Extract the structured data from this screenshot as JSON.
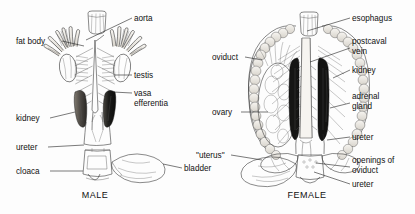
{
  "figure": {
    "background_color": "#fdfdfd",
    "ink_color": "#2a2a2a",
    "captions": [
      {
        "id": "male",
        "text": "MALE",
        "x": 95,
        "y": 198
      },
      {
        "id": "female",
        "text": "FEMALE",
        "x": 307,
        "y": 198
      }
    ]
  },
  "male_panel": {
    "caption": "MALE",
    "labels": [
      {
        "id": "fat-body",
        "text": "fat body",
        "x": 16,
        "y": 44,
        "anchor": "start",
        "leader": "M62,41 L84,46"
      },
      {
        "id": "aorta",
        "text": "aorta",
        "x": 134,
        "y": 21,
        "anchor": "start",
        "leader": "M132,18 L86,40"
      },
      {
        "id": "testis",
        "text": "testis",
        "x": 134,
        "y": 78,
        "anchor": "start",
        "leader": "M132,75 L115,75"
      },
      {
        "id": "vasa-efferentia",
        "text": "vasa",
        "x": 134,
        "y": 96,
        "anchor": "start",
        "leader": "M132,93 L113,92"
      },
      {
        "id": "vasa-efferentia-2",
        "text": "efferentia",
        "x": 134,
        "y": 106,
        "anchor": "start",
        "leader": ""
      },
      {
        "id": "kidney",
        "text": "kidney",
        "x": 16,
        "y": 121,
        "anchor": "start",
        "leader": "M50,118 L75,112"
      },
      {
        "id": "ureter",
        "text": "ureter",
        "x": 16,
        "y": 150,
        "anchor": "start",
        "leader": "M48,147 L84,145"
      },
      {
        "id": "cloaca",
        "text": "cloaca",
        "x": 16,
        "y": 174,
        "anchor": "start",
        "leader": "M50,171 L83,171"
      },
      {
        "id": "bladder",
        "text": "bladder",
        "x": 184,
        "y": 171,
        "anchor": "start",
        "leader": "M182,168 L163,164"
      }
    ],
    "structures": [
      "esophagus-stump",
      "fat-body-left",
      "fat-body-right",
      "testis-left",
      "testis-right",
      "kidney-left",
      "kidney-right",
      "dorsal-aorta",
      "vasa-efferentia",
      "ureter",
      "cloaca",
      "urinary-bladder"
    ]
  },
  "female_panel": {
    "caption": "FEMALE",
    "labels": [
      {
        "id": "esophagus",
        "text": "esophagus",
        "x": 352,
        "y": 21,
        "anchor": "start",
        "leader": "M350,18 L307,31"
      },
      {
        "id": "postcaval-vein",
        "text": "postcaval",
        "x": 352,
        "y": 44,
        "anchor": "start",
        "leader": "M350,48 L310,62"
      },
      {
        "id": "postcaval-vein-2",
        "text": "vein",
        "x": 352,
        "y": 54,
        "anchor": "start",
        "leader": ""
      },
      {
        "id": "kidney",
        "text": "kidney",
        "x": 352,
        "y": 73,
        "anchor": "start",
        "leader": "M350,70 L333,78"
      },
      {
        "id": "adrenal-gland",
        "text": "adrenal",
        "x": 352,
        "y": 99,
        "anchor": "start",
        "leader": "M350,103 L330,108"
      },
      {
        "id": "adrenal-gland-2",
        "text": "gland",
        "x": 352,
        "y": 109,
        "anchor": "start",
        "leader": ""
      },
      {
        "id": "ureter",
        "text": "ureter",
        "x": 352,
        "y": 140,
        "anchor": "start",
        "leader": "M350,137 L327,140"
      },
      {
        "id": "openings-oviduct",
        "text": "openings of",
        "x": 352,
        "y": 163,
        "anchor": "start",
        "leader": "M350,167 L316,163"
      },
      {
        "id": "openings-oviduct-2",
        "text": "oviduct",
        "x": 352,
        "y": 173,
        "anchor": "start",
        "leader": ""
      },
      {
        "id": "ureter-lower",
        "text": "ureter",
        "x": 352,
        "y": 187,
        "anchor": "start",
        "leader": "M350,184 L314,172"
      },
      {
        "id": "oviduct",
        "text": "oviduct",
        "x": 212,
        "y": 60,
        "anchor": "start",
        "leader": "M245,57 L262,60"
      },
      {
        "id": "ovary",
        "text": "ovary",
        "x": 212,
        "y": 115,
        "anchor": "start",
        "leader": "M241,112 L268,112"
      },
      {
        "id": "uterus",
        "text": "\"uterus\"",
        "x": 196,
        "y": 158,
        "anchor": "start",
        "leader": "M231,155 L262,160"
      }
    ],
    "structures": [
      "esophagus",
      "oviduct-coiled-left",
      "oviduct-coiled-right",
      "ovary",
      "kidney-left",
      "kidney-right",
      "postcaval-vein",
      "adrenal-gland",
      "ureter",
      "uterus-left",
      "uterus-right",
      "urinary-bladder",
      "cloaca"
    ]
  }
}
